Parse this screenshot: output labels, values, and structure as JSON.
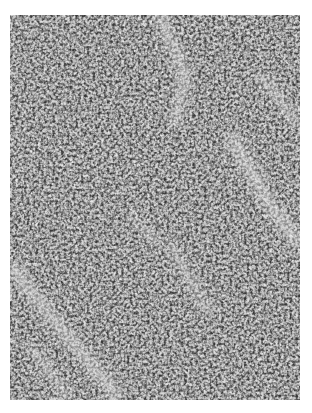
{
  "image": {
    "subject": "grayscale histology micrograph",
    "description": "Densely packed hyperchromatic pleomorphic cells with scattered lighter fibrous stroma streaks",
    "colors": {
      "background": "#ffffff",
      "tissue_light": "#d8d8d8",
      "tissue_mid": "#8a8a8a",
      "nuclei_dark": "#2e2e2e"
    }
  }
}
